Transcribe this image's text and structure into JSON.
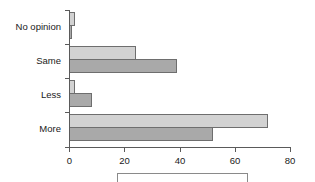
{
  "chart_data": {
    "type": "bar",
    "orientation": "horizontal",
    "title": "",
    "subtitle": "",
    "xlabel": "",
    "ylabel": "",
    "categories": [
      "No opinion",
      "Same",
      "Less",
      "More"
    ],
    "series": [
      {
        "name": "",
        "color": "#d2d2d2",
        "values": [
          2,
          24,
          2,
          72
        ]
      },
      {
        "name": "",
        "color": "#a9a9a9",
        "values": [
          1,
          39,
          8,
          52
        ]
      }
    ],
    "xlim": [
      0,
      80
    ],
    "xticks": [
      0,
      20,
      40,
      60,
      80
    ],
    "xtick_labels": [
      "0",
      "20",
      "40",
      "60",
      "80"
    ],
    "grid": false,
    "legend_position": "bottom",
    "legend_entries": []
  },
  "colors": {
    "series_light": "#d2d2d2",
    "series_dark": "#a9a9a9",
    "bar_edge": "#6e6e6e",
    "axis": "#5a5a5a",
    "text": "#1a1a1a",
    "legend_border": "#8a8a8a",
    "background": "#ffffff"
  },
  "geometry": {
    "plot_left": 69,
    "plot_right": 290,
    "plot_top": 10,
    "plot_bottom": 147
  }
}
